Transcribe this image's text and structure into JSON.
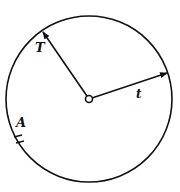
{
  "diagram": {
    "circle": {
      "cx": 89,
      "cy": 99,
      "r": 83,
      "stroke": "#111111"
    },
    "center_point": {
      "cx": 89,
      "cy": 99,
      "r": 3.5
    },
    "vectors": [
      {
        "name": "T",
        "label": "T",
        "x2": 43,
        "y2": 32,
        "label_x": 35,
        "label_y": 52
      },
      {
        "name": "t",
        "label": "t",
        "x2": 167,
        "y2": 73,
        "label_x": 136,
        "label_y": 98
      }
    ],
    "point_A": {
      "label": "A",
      "label_x": 16,
      "label_y": 127
    },
    "labels": {
      "T": "T",
      "t": "t",
      "A": "A"
    }
  }
}
